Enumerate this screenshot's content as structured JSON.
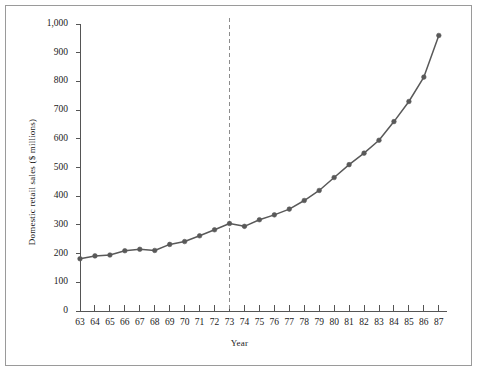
{
  "chart_data": {
    "type": "line",
    "title": "",
    "xlabel": "Year",
    "ylabel": "Domestic retail sales ($ millions)",
    "xlim": [
      63,
      87
    ],
    "ylim": [
      0,
      1000
    ],
    "ytick_labels": [
      "1,000",
      "900",
      "800",
      "700",
      "600",
      "500",
      "400",
      "300",
      "200",
      "100",
      "0"
    ],
    "ytick_values": [
      1000,
      900,
      800,
      700,
      600,
      500,
      400,
      300,
      200,
      100,
      0
    ],
    "xtick_labels": [
      "63",
      "64",
      "65",
      "66",
      "67",
      "68",
      "69",
      "70",
      "71",
      "72",
      "73",
      "74",
      "75",
      "76",
      "77",
      "78",
      "79",
      "80",
      "81",
      "82",
      "83",
      "84",
      "85",
      "86",
      "87"
    ],
    "categories": [
      63,
      64,
      65,
      66,
      67,
      68,
      69,
      70,
      71,
      72,
      73,
      74,
      75,
      76,
      77,
      78,
      79,
      80,
      81,
      82,
      83,
      84,
      85,
      86,
      87
    ],
    "values": [
      182,
      192,
      195,
      210,
      215,
      211,
      232,
      242,
      262,
      283,
      305,
      295,
      318,
      335,
      355,
      385,
      420,
      465,
      510,
      550,
      595,
      660,
      730,
      815,
      960
    ],
    "grid": false,
    "legend": null,
    "markers": true,
    "line_color": "#595959",
    "marker_color": "#595959",
    "annotations": [
      {
        "type": "vertical-dashed-line",
        "x": 73,
        "color": "#8c8c8c",
        "label": ""
      }
    ]
  },
  "figure": {
    "border_color": "#9a9a9a",
    "background": "#ffffff"
  }
}
